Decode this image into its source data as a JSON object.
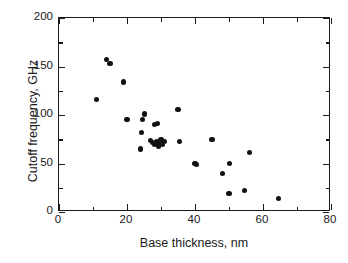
{
  "chart_data": {
    "type": "scatter",
    "title": "",
    "xlabel": "Base thickness, nm",
    "ylabel": "Cutoff frequency, GHz",
    "xlim": [
      0,
      80
    ],
    "ylim": [
      0,
      200
    ],
    "grid": false,
    "legend": null,
    "marker": "filled-circle",
    "marker_color": "#111111",
    "xticks_major": [
      0,
      20,
      40,
      60,
      80
    ],
    "xticks_minor": [
      10,
      30,
      50,
      70
    ],
    "yticks_major": [
      0,
      50,
      100,
      150,
      200
    ],
    "yticks_minor": [
      25,
      75,
      125,
      175
    ],
    "xtick_labels": [
      "0",
      "20",
      "40",
      "60",
      "80"
    ],
    "ytick_labels": [
      "0",
      "50",
      "100",
      "150",
      "200"
    ],
    "series": [
      {
        "name": "Cutoff frequency vs base thickness",
        "points": [
          [
            11.0,
            116
          ],
          [
            14.0,
            157
          ],
          [
            15.0,
            153
          ],
          [
            19.0,
            134
          ],
          [
            20.0,
            95
          ],
          [
            24.0,
            65
          ],
          [
            24.3,
            82
          ],
          [
            24.6,
            95
          ],
          [
            25.2,
            101
          ],
          [
            27.0,
            74
          ],
          [
            27.6,
            72
          ],
          [
            28.0,
            90
          ],
          [
            28.2,
            70
          ],
          [
            28.6,
            73
          ],
          [
            29.0,
            91
          ],
          [
            29.2,
            68
          ],
          [
            29.6,
            71
          ],
          [
            30.0,
            75
          ],
          [
            30.4,
            70
          ],
          [
            31.0,
            73
          ],
          [
            35.0,
            106
          ],
          [
            35.4,
            73
          ],
          [
            40.0,
            50
          ],
          [
            40.4,
            49
          ],
          [
            45.0,
            75
          ],
          [
            48.0,
            40
          ],
          [
            50.0,
            19
          ],
          [
            50.2,
            50
          ],
          [
            54.5,
            22
          ],
          [
            56.0,
            61
          ],
          [
            64.5,
            14
          ]
        ]
      }
    ]
  },
  "figure": {
    "background": "#ffffff",
    "frame_color": "#1a1a1a",
    "accent": "#111111"
  }
}
